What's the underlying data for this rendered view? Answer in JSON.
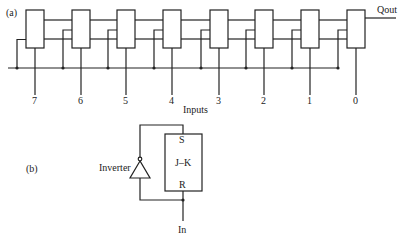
{
  "part_a": {
    "label": "(a)",
    "output_label": "Qout",
    "inputs_label": "Inputs",
    "stages": [
      {
        "input": "7",
        "x": 26
      },
      {
        "input": "6",
        "x": 72
      },
      {
        "input": "5",
        "x": 117
      },
      {
        "input": "4",
        "x": 163
      },
      {
        "input": "3",
        "x": 210
      },
      {
        "input": "2",
        "x": 255
      },
      {
        "input": "1",
        "x": 301
      },
      {
        "input": "0",
        "x": 347
      }
    ]
  },
  "part_b": {
    "label": "(b)",
    "inverter_label": "Inverter",
    "flipflop_label": "J–K",
    "set_label": "S",
    "reset_label": "R",
    "input_label": "In"
  },
  "colors": {
    "line": "#222222",
    "background": "#ffffff"
  }
}
